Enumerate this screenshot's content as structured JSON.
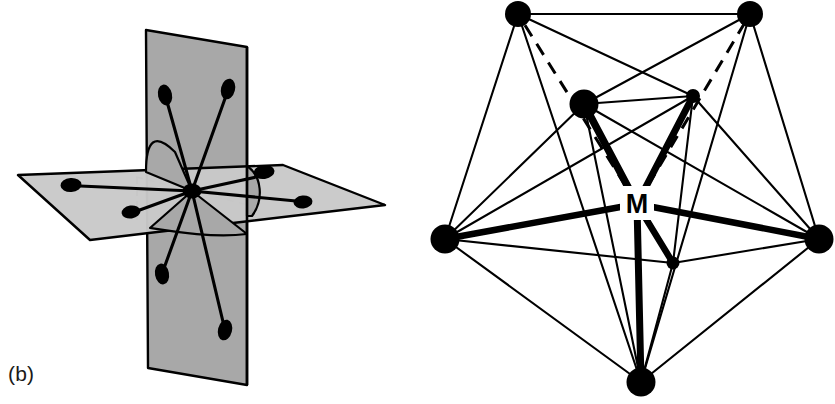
{
  "figure": {
    "width": 835,
    "height": 404,
    "background": "#ffffff",
    "ink_color": "#000000",
    "plane_fill_dark": "#a8a8a8",
    "plane_fill_light": "#c9c9c9",
    "plane_stroke": "#000000"
  },
  "panels": [
    {
      "id": "panel-b",
      "label": "(b)",
      "caption_position": "bottom-left",
      "description": "Two intersecting mirror planes with eight lone-pair / ligand lobes radiating from a central atom",
      "central_atom": {
        "name": "central-atom",
        "cx": 192,
        "cy": 191,
        "rx": 9,
        "ry": 7
      },
      "planes": [
        {
          "name": "vertical-mirror-plane",
          "fill": "#a8a8a8",
          "points": "146,30 247,47 247,385 148,368"
        },
        {
          "name": "horizontal-mirror-plane",
          "fill": "#c9c9c9",
          "points": "18,175 283,165 385,205 90,240"
        }
      ],
      "lobes": [
        {
          "name": "lobe-upper-left",
          "tip_x": 165,
          "tip_y": 95,
          "rx": 7,
          "ry": 10,
          "angle": -12
        },
        {
          "name": "lobe-upper-right",
          "tip_x": 228,
          "tip_y": 89,
          "rx": 7,
          "ry": 10,
          "angle": 14
        },
        {
          "name": "lobe-lower-left",
          "tip_x": 162,
          "tip_y": 275,
          "rx": 7,
          "ry": 10,
          "angle": -10
        },
        {
          "name": "lobe-lower-right",
          "tip_x": 225,
          "tip_y": 330,
          "rx": 7,
          "ry": 10,
          "angle": 14
        },
        {
          "name": "lobe-left-far",
          "tip_x": 72,
          "tip_y": 185,
          "rx": 10,
          "ry": 7,
          "angle": -4
        },
        {
          "name": "lobe-left-near",
          "tip_x": 131,
          "tip_y": 212,
          "rx": 9,
          "ry": 6,
          "angle": -8
        },
        {
          "name": "lobe-right-far",
          "tip_x": 263,
          "tip_y": 172,
          "rx": 10,
          "ry": 7,
          "angle": -6
        },
        {
          "name": "lobe-right-near",
          "tip_x": 303,
          "tip_y": 202,
          "rx": 9,
          "ry": 6,
          "angle": -6
        }
      ],
      "hidden_edges": "dashed grey construction lines behind central atom"
    },
    {
      "id": "panel-c",
      "label": "(c)",
      "caption_position": "bottom-left",
      "description": "Tricapped trigonal prism / nine-vertex polyhedron about a central metal atom M",
      "center_label": {
        "name": "metal-center-label",
        "text": "M",
        "x": 636,
        "y": 203
      },
      "vertices": [
        {
          "name": "vertex-top-left",
          "id": "A",
          "cx": 518,
          "cy": 14,
          "r": 13
        },
        {
          "name": "vertex-top-right",
          "id": "B",
          "cx": 750,
          "cy": 14,
          "r": 13
        },
        {
          "name": "vertex-inner-left",
          "id": "C",
          "cx": 584,
          "cy": 104,
          "r": 14
        },
        {
          "name": "vertex-inner-right",
          "id": "D",
          "cx": 693,
          "cy": 96,
          "r": 7
        },
        {
          "name": "vertex-left",
          "id": "E",
          "cx": 445,
          "cy": 239,
          "r": 14
        },
        {
          "name": "vertex-right",
          "id": "F",
          "cx": 819,
          "cy": 239,
          "r": 14
        },
        {
          "name": "vertex-inner-lower",
          "id": "G",
          "cx": 673,
          "cy": 263,
          "r": 6
        },
        {
          "name": "vertex-bottom",
          "id": "H",
          "cx": 641,
          "cy": 382,
          "r": 14
        }
      ],
      "metal_center": {
        "name": "metal-center-point",
        "cx": 637,
        "cy": 204
      },
      "bonds_to_metal": [
        {
          "from": "C",
          "style": "solid-thick"
        },
        {
          "from": "D",
          "style": "solid-thick"
        },
        {
          "from": "E",
          "style": "solid-thick"
        },
        {
          "from": "F",
          "style": "solid-thick"
        },
        {
          "from": "G",
          "style": "solid-thick"
        },
        {
          "from": "H",
          "style": "solid-thick"
        },
        {
          "from": "A",
          "style": "dashed-hidden"
        },
        {
          "from": "B",
          "style": "dashed-hidden"
        }
      ],
      "polyhedron_edges": [
        [
          "A",
          "B"
        ],
        [
          "A",
          "C"
        ],
        [
          "A",
          "D"
        ],
        [
          "A",
          "E"
        ],
        [
          "A",
          "H"
        ],
        [
          "B",
          "C"
        ],
        [
          "B",
          "D"
        ],
        [
          "B",
          "F"
        ],
        [
          "B",
          "H"
        ],
        [
          "C",
          "D"
        ],
        [
          "C",
          "E"
        ],
        [
          "C",
          "F"
        ],
        [
          "C",
          "G"
        ],
        [
          "C",
          "H"
        ],
        [
          "D",
          "F"
        ],
        [
          "D",
          "G"
        ],
        [
          "D",
          "H"
        ],
        [
          "E",
          "F"
        ],
        [
          "E",
          "G"
        ],
        [
          "E",
          "H"
        ],
        [
          "E",
          "D"
        ],
        [
          "F",
          "G"
        ],
        [
          "F",
          "H"
        ],
        [
          "G",
          "H"
        ]
      ]
    }
  ]
}
